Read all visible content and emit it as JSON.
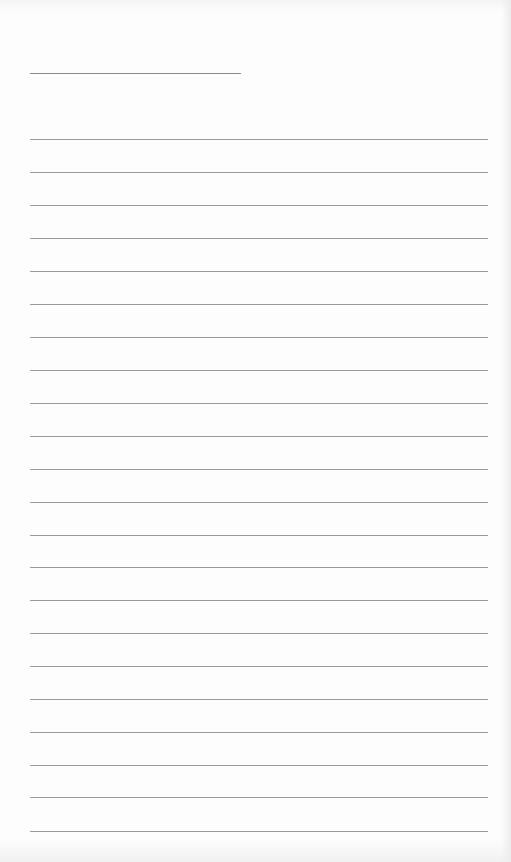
{
  "page": {
    "type": "lined-notepad-sheet",
    "background_color": "#fdfdfd",
    "line_color": "#9a9a9a",
    "header_line": {
      "y": 73,
      "x_start": 30,
      "x_end": 241
    },
    "ruled_lines": {
      "count": 22,
      "x_start": 30,
      "x_end": 488,
      "y_positions": [
        139,
        172,
        205,
        238,
        271,
        304,
        337,
        370,
        403,
        436,
        469,
        502,
        535,
        567,
        600,
        633,
        666,
        699,
        732,
        765,
        797,
        831
      ]
    }
  }
}
